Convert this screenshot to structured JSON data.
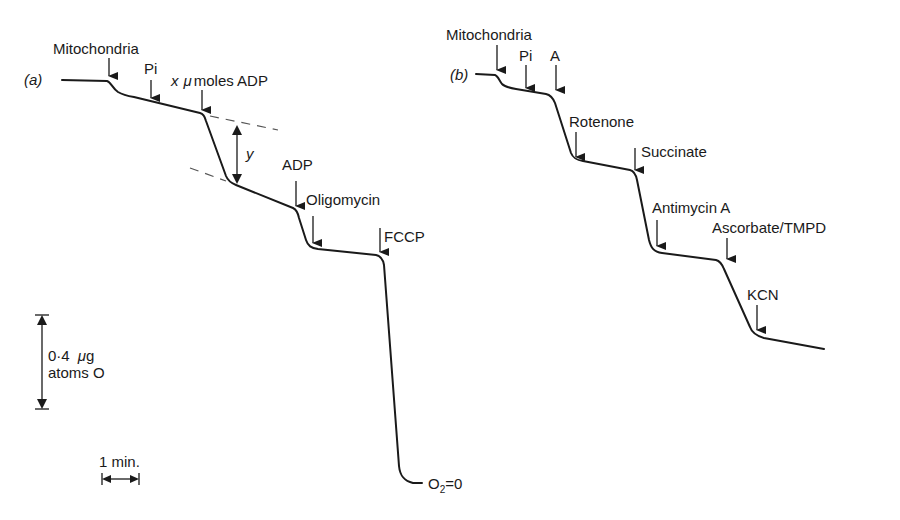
{
  "figure": {
    "panel_a": {
      "label": "(a)",
      "additions": [
        {
          "label": "Mitochondria"
        },
        {
          "label": "Pi"
        },
        {
          "label": "x μmoles ADP",
          "prefix": "x",
          "mu": "μ",
          "rest": "moles ADP"
        },
        {
          "label": "ADP"
        },
        {
          "label": "Oligomycin"
        },
        {
          "label": "FCCP"
        }
      ],
      "y_marker": "y",
      "end_label": {
        "base": "O",
        "sub": "2",
        "rest": "=0"
      }
    },
    "panel_b": {
      "label": "(b)",
      "additions": [
        {
          "label": "Mitochondria"
        },
        {
          "label": "Pi"
        },
        {
          "label": "A"
        },
        {
          "label": "Rotenone"
        },
        {
          "label": "Succinate"
        },
        {
          "label": "Antimycin A"
        },
        {
          "label": "Ascorbate/TMPD"
        },
        {
          "label": "KCN"
        }
      ]
    },
    "scale_bars": {
      "oxygen": {
        "line1_num": "0·4",
        "line1_mu": "μ",
        "line1_unit": "g",
        "line2": "atoms O"
      },
      "time": {
        "label": "1 min."
      }
    },
    "colors": {
      "ink": "#1a1a1a",
      "background": "#ffffff"
    }
  }
}
